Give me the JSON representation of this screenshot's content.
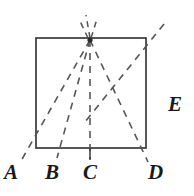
{
  "figure": {
    "type": "geometry-diagram",
    "stroke_color": "#3a3a3a",
    "dash_color": "#555555",
    "background": "#ffffff",
    "canvas": {
      "width": 194,
      "height": 196
    },
    "square": {
      "left": 36,
      "top": 38,
      "right": 146,
      "bottom": 148,
      "stroke_width": 1.6
    },
    "apex": {
      "x": 90,
      "y": 40
    },
    "labels": [
      {
        "id": "A",
        "text": "A",
        "x": 10,
        "y": 178
      },
      {
        "id": "B",
        "text": "B",
        "x": 52,
        "y": 178
      },
      {
        "id": "C",
        "text": "C",
        "x": 90,
        "y": 178
      },
      {
        "id": "D",
        "text": "D",
        "x": 155,
        "y": 178
      },
      {
        "id": "E",
        "text": "E",
        "x": 175,
        "y": 106
      }
    ],
    "rays": [
      {
        "id": "ray-apex-A",
        "from": [
          90,
          40
        ],
        "to": [
          22,
          160
        ]
      },
      {
        "id": "ray-apex-B",
        "from": [
          90,
          40
        ],
        "to": [
          58,
          156
        ]
      },
      {
        "id": "ray-apex-C",
        "from": [
          90,
          40
        ],
        "to": [
          90,
          158
        ]
      },
      {
        "id": "ray-apex-D",
        "from": [
          90,
          40
        ],
        "to": [
          147,
          160
        ]
      },
      {
        "id": "ray-diagonal-E",
        "from": [
          163,
          25
        ],
        "to": [
          86,
          120
        ]
      },
      {
        "id": "ray-apex-up",
        "from": [
          90,
          40
        ],
        "to": [
          86,
          16
        ]
      },
      {
        "id": "ray-apex-up-left",
        "from": [
          90,
          40
        ],
        "to": [
          80,
          20
        ]
      },
      {
        "id": "ray-apex-up-right",
        "from": [
          90,
          40
        ],
        "to": [
          96,
          20
        ]
      }
    ],
    "ticks": [
      {
        "id": "tick-C",
        "x": 90,
        "y1": 148,
        "y2": 160
      }
    ]
  }
}
